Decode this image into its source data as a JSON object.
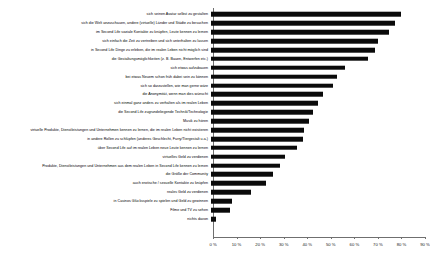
{
  "chart_data": {
    "type": "bar",
    "orientation": "horizontal",
    "title": "",
    "xlabel": "",
    "ylabel": "",
    "xlim": [
      0,
      90
    ],
    "xticks": [
      "0 %",
      "10 %",
      "20 %",
      "30 %",
      "40 %",
      "50 %",
      "60 %",
      "70 %",
      "80 %",
      "90 %"
    ],
    "xtick_values": [
      0,
      10,
      20,
      30,
      40,
      50,
      60,
      70,
      80,
      90
    ],
    "grid": false,
    "legend": false,
    "bar_color": "#0a0a0a",
    "axis_color": "#6f6f6f",
    "categories": [
      "sich seinen Avatar selbst zu gestalten",
      "sich die Welt anzuschauen, andere (virtuelle) Länder und Städte zu besuchen",
      "im Second Life soziale Kontakte zu knüpfen, Leute kennen zu lernen",
      "sich einfach die Zeit zu vertreiben und sich unterhalten zu lassen",
      "in Second Life Dinge zu erleben, die im realen Leben nicht möglich sind",
      "die Gestaltungsmöglichkeiten (z. B. Bauen, Entwerfen etc.)",
      "sich etwas aufzubauen",
      "bei etwas Neuem schon früh dabei sein zu können",
      "sich so darzustellen, wie man gerne wäre",
      "die Anonymität, wenn man dies wünscht",
      "sich einmal ganz anders zu verhalten als im realen Leben",
      "die Second Life zugrundeliegende Technik/Technologie",
      "Musik zu hören",
      "virtuelle Produkte, Dienstleistungen und Unternehmen kennen zu lernen, die im realen Leben nicht existieren",
      "in andere Rollen zu schlüpfen (anderes Geschlecht, Furry/Tiergestalt u.a.)",
      "über Second Life auf im realen Leben neue Leute kennen zu lernen",
      "virtuelles Geld zu verdienen",
      "Produkte, Dienstleistungen und Unternehmen aus dem realen Leben in Second Life kennen zu lernen",
      "die Größe der Community",
      "auch erotische / sexuelle Kontakte zu knüpfen",
      "reales Geld zu verdienen",
      "in Casinos Glücksspiele zu spielen und Geld zu gewinnen",
      "Filme und TV zu sehen",
      "nichts davon"
    ],
    "values": [
      80.5,
      78.0,
      75.5,
      71.0,
      69.5,
      66.5,
      57.0,
      53.5,
      52.0,
      47.5,
      45.5,
      43.5,
      41.5,
      39.5,
      39.0,
      36.5,
      31.5,
      29.5,
      26.5,
      23.5,
      17.0,
      9.0,
      8.0,
      2.0
    ]
  }
}
